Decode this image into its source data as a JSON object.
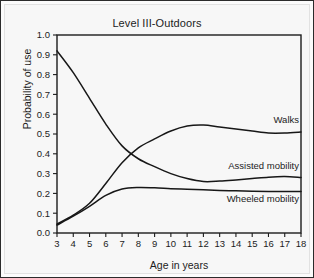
{
  "figure": {
    "background_color": "#f7f7f7",
    "border_color": "#2b2b2b",
    "line_color": "#171717"
  },
  "chart_data": {
    "type": "line",
    "title": "Level III-Outdoors",
    "xlabel": "Age in years",
    "ylabel": "Probability of use",
    "xlim": [
      3,
      18
    ],
    "ylim": [
      0.0,
      1.0
    ],
    "grid": false,
    "legend_position": "inline-right",
    "x_tick_labels": [
      "3",
      "4",
      "5",
      "6",
      "7",
      "8",
      "9",
      "10",
      "11",
      "12",
      "13",
      "14",
      "15",
      "16",
      "17",
      "18"
    ],
    "y_tick_labels": [
      "0.0",
      "0.1",
      "0.2",
      "0.3",
      "0.4",
      "0.5",
      "0.6",
      "0.7",
      "0.8",
      "0.9",
      "1.0"
    ],
    "x": [
      3,
      4,
      5,
      6,
      7,
      8,
      9,
      10,
      11,
      12,
      13,
      14,
      15,
      16,
      17,
      18
    ],
    "series": [
      {
        "name": "Walks",
        "values": [
          0.045,
          0.09,
          0.15,
          0.25,
          0.355,
          0.43,
          0.475,
          0.515,
          0.54,
          0.545,
          0.535,
          0.525,
          0.515,
          0.505,
          0.505,
          0.51
        ]
      },
      {
        "name": "Assisted mobility",
        "values": [
          0.92,
          0.81,
          0.68,
          0.55,
          0.44,
          0.375,
          0.335,
          0.3,
          0.275,
          0.26,
          0.262,
          0.268,
          0.275,
          0.282,
          0.285,
          0.28
        ]
      },
      {
        "name": "Wheeled mobility",
        "values": [
          0.04,
          0.085,
          0.135,
          0.19,
          0.222,
          0.23,
          0.228,
          0.224,
          0.221,
          0.218,
          0.215,
          0.213,
          0.211,
          0.21,
          0.21,
          0.21
        ]
      }
    ]
  }
}
